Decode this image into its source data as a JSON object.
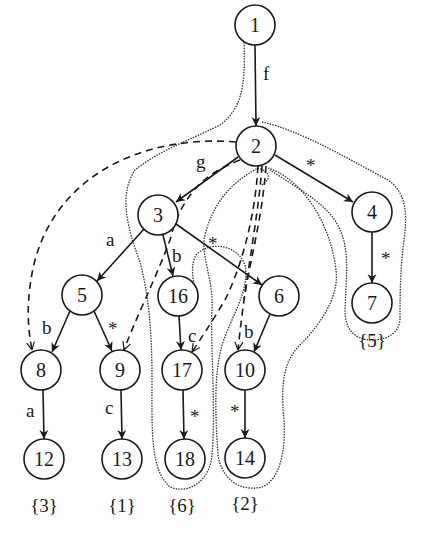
{
  "diagram": {
    "type": "tree-automaton",
    "nodes": [
      {
        "id": "1",
        "label": "1",
        "x": 255,
        "y": 25
      },
      {
        "id": "2",
        "label": "2",
        "x": 256,
        "y": 146
      },
      {
        "id": "3",
        "label": "3",
        "x": 158,
        "y": 215
      },
      {
        "id": "4",
        "label": "4",
        "x": 372,
        "y": 212
      },
      {
        "id": "5",
        "label": "5",
        "x": 82,
        "y": 295
      },
      {
        "id": "16",
        "label": "16",
        "x": 178,
        "y": 296
      },
      {
        "id": "6",
        "label": "6",
        "x": 279,
        "y": 296
      },
      {
        "id": "7",
        "label": "7",
        "x": 372,
        "y": 303
      },
      {
        "id": "8",
        "label": "8",
        "x": 41,
        "y": 370
      },
      {
        "id": "9",
        "label": "9",
        "x": 120,
        "y": 370
      },
      {
        "id": "17",
        "label": "17",
        "x": 182,
        "y": 370
      },
      {
        "id": "10",
        "label": "10",
        "x": 245,
        "y": 370
      },
      {
        "id": "12",
        "label": "12",
        "x": 44,
        "y": 459
      },
      {
        "id": "13",
        "label": "13",
        "x": 122,
        "y": 459
      },
      {
        "id": "18",
        "label": "18",
        "x": 185,
        "y": 459
      },
      {
        "id": "14",
        "label": "14",
        "x": 245,
        "y": 458
      }
    ],
    "edges": [
      {
        "from": "1",
        "to": "2",
        "label": "f"
      },
      {
        "from": "2",
        "to": "3",
        "label": "g"
      },
      {
        "from": "2",
        "to": "4",
        "label": "*"
      },
      {
        "from": "3",
        "to": "5",
        "label": "a"
      },
      {
        "from": "3",
        "to": "16",
        "label": "b"
      },
      {
        "from": "3",
        "to": "6",
        "label": "*"
      },
      {
        "from": "4",
        "to": "7",
        "label": "*"
      },
      {
        "from": "5",
        "to": "8",
        "label": "b"
      },
      {
        "from": "5",
        "to": "9",
        "label": "*"
      },
      {
        "from": "16",
        "to": "17",
        "label": "c"
      },
      {
        "from": "6",
        "to": "10",
        "label": "b"
      },
      {
        "from": "8",
        "to": "12",
        "label": "a"
      },
      {
        "from": "9",
        "to": "13",
        "label": "c"
      },
      {
        "from": "17",
        "to": "18",
        "label": "*"
      },
      {
        "from": "10",
        "to": "14",
        "label": "*"
      }
    ],
    "dashed_edges": [
      {
        "from": "2",
        "to": "8"
      },
      {
        "from": "2",
        "to": "9"
      },
      {
        "from": "2",
        "to": "17"
      },
      {
        "from": "2",
        "to": "10"
      }
    ],
    "set_labels": [
      {
        "text": "{3}",
        "x": 44,
        "y": 512
      },
      {
        "text": "{1}",
        "x": 122,
        "y": 512
      },
      {
        "text": "{6}",
        "x": 182,
        "y": 512
      },
      {
        "text": "{2}",
        "x": 245,
        "y": 510
      },
      {
        "text": "{5}",
        "x": 372,
        "y": 347
      }
    ]
  }
}
